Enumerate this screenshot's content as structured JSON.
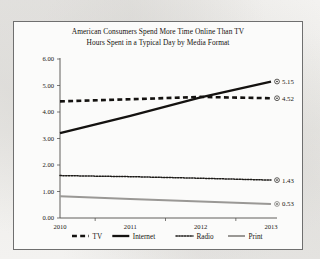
{
  "chart_data": {
    "type": "line",
    "title": "American Consumers Spend More Time Online Than TV",
    "subtitle": "Hours Spent in a Typical Day by Media Format",
    "xlabel": "",
    "ylabel": "",
    "x": [
      "2010",
      "2011",
      "2012",
      "2013"
    ],
    "xlim": [
      2010,
      2013
    ],
    "ylim": [
      0.0,
      6.0
    ],
    "yticks": [
      "0.00",
      "1.00",
      "2.00",
      "3.00",
      "4.00",
      "5.00",
      "6.00"
    ],
    "ytick_values": [
      0.0,
      1.0,
      2.0,
      3.0,
      4.0,
      5.0,
      6.0
    ],
    "grid": false,
    "legend_position": "bottom",
    "series": [
      {
        "name": "TV",
        "values": [
          4.4,
          4.48,
          4.57,
          4.52
        ],
        "end_label": "4.52",
        "style": "dashed",
        "color": "#141210",
        "width": 2.6
      },
      {
        "name": "Internet",
        "values": [
          3.2,
          3.85,
          4.55,
          5.15
        ],
        "end_label": "5.15",
        "style": "solid",
        "color": "#141210",
        "width": 2.3
      },
      {
        "name": "Radio",
        "values": [
          1.6,
          1.56,
          1.5,
          1.43
        ],
        "end_label": "1.43",
        "style": "dotted",
        "color": "#1c1a17",
        "width": 1.5
      },
      {
        "name": "Print",
        "values": [
          0.82,
          0.72,
          0.62,
          0.53
        ],
        "end_label": "0.53",
        "style": "solid",
        "color": "#9a9895",
        "width": 2.0
      }
    ]
  },
  "legend": {
    "items": [
      {
        "label": "TV",
        "marker": "dashed-swatch"
      },
      {
        "label": "Internet",
        "marker": "solid-swatch"
      },
      {
        "label": "Radio",
        "marker": "dotted-swatch"
      },
      {
        "label": "Print",
        "marker": "gray-solid-swatch"
      }
    ]
  }
}
